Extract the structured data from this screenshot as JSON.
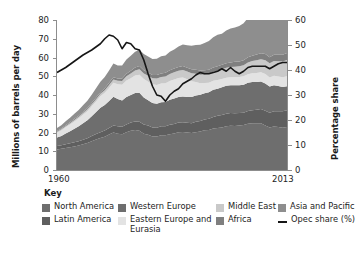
{
  "axes": {
    "y_left_title": "Millions of barrels per day",
    "y_right_title": "Percentage share",
    "y_left_ticks": [
      "0",
      "10",
      "20",
      "30",
      "40",
      "50",
      "60",
      "70",
      "80"
    ],
    "y_right_ticks": [
      "0",
      "10",
      "20",
      "30",
      "40",
      "50",
      "60"
    ],
    "x_ticks": [
      "1960",
      "2013"
    ]
  },
  "legend": {
    "title": "Key",
    "items": [
      {
        "label": "North America",
        "color": "#6e6e6e",
        "type": "area",
        "name": "legend-north-america"
      },
      {
        "label": "Western Europe",
        "color": "#6e6e6e",
        "type": "area",
        "name": "legend-western-europe"
      },
      {
        "label": "Middle East",
        "color": "#c9c9c9",
        "type": "area",
        "name": "legend-middle-east"
      },
      {
        "label": "Asia and Pacific",
        "color": "#8e8e8e",
        "type": "area",
        "name": "legend-asia-pacific"
      },
      {
        "label": "Latin America",
        "color": "#5f5f5f",
        "type": "area",
        "name": "legend-latin-america"
      },
      {
        "label": "Eastern Europe and Eurasia",
        "color": "#e3e3e3",
        "type": "area",
        "name": "legend-eastern-europe-eurasia"
      },
      {
        "label": "Africa",
        "color": "#7f7f7f",
        "type": "area",
        "name": "legend-africa"
      },
      {
        "label": "Opec share (%)",
        "color": "#161616",
        "type": "line",
        "name": "legend-opec-share"
      }
    ]
  },
  "chart_data": {
    "type": "area",
    "title": "",
    "xlabel": "",
    "ylabel": "Millions of barrels per day",
    "ylabel_secondary": "Percentage share",
    "xlim": [
      1960,
      2013
    ],
    "ylim": [
      0,
      80
    ],
    "ylim_secondary": [
      0,
      60
    ],
    "grid": false,
    "legend_position": "bottom",
    "stacked": true,
    "x": [
      1960,
      1961,
      1962,
      1963,
      1964,
      1965,
      1966,
      1967,
      1968,
      1969,
      1970,
      1971,
      1972,
      1973,
      1974,
      1975,
      1976,
      1977,
      1978,
      1979,
      1980,
      1981,
      1982,
      1983,
      1984,
      1985,
      1986,
      1987,
      1988,
      1989,
      1990,
      1991,
      1992,
      1993,
      1994,
      1995,
      1996,
      1997,
      1998,
      1999,
      2000,
      2001,
      2002,
      2003,
      2004,
      2005,
      2006,
      2007,
      2008,
      2009,
      2010,
      2011,
      2012,
      2013
    ],
    "series": [
      {
        "name": "North America",
        "color": "#6e6e6e",
        "values": [
          11.0,
          11.3,
          11.8,
          12.2,
          12.6,
          13.1,
          13.8,
          14.4,
          15.4,
          16.3,
          17.1,
          17.8,
          18.9,
          20.0,
          19.4,
          19.1,
          20.1,
          20.9,
          21.3,
          20.9,
          19.4,
          18.8,
          17.9,
          17.9,
          18.5,
          18.6,
          19.1,
          19.5,
          20.1,
          20.3,
          20.0,
          19.7,
          20.2,
          20.6,
          21.2,
          21.4,
          22.1,
          22.4,
          22.7,
          23.3,
          23.6,
          23.5,
          23.7,
          24.0,
          24.7,
          24.9,
          24.9,
          25.0,
          23.8,
          22.7,
          23.2,
          22.9,
          22.6,
          23.0
        ]
      },
      {
        "name": "Latin America",
        "color": "#5f5f5f",
        "values": [
          1.8,
          1.9,
          2.0,
          2.1,
          2.2,
          2.3,
          2.4,
          2.5,
          2.7,
          2.9,
          3.1,
          3.3,
          3.5,
          3.8,
          3.9,
          4.0,
          4.2,
          4.4,
          4.6,
          4.8,
          4.9,
          4.9,
          4.8,
          4.7,
          4.8,
          4.8,
          5.0,
          5.1,
          5.2,
          5.2,
          5.2,
          5.3,
          5.5,
          5.6,
          5.8,
          5.9,
          6.2,
          6.5,
          6.7,
          6.7,
          6.8,
          6.8,
          6.7,
          6.6,
          6.8,
          7.0,
          7.2,
          7.5,
          7.8,
          7.8,
          8.2,
          8.5,
          8.7,
          8.9
        ]
      },
      {
        "name": "Western Europe",
        "color": "#6e6e6e",
        "values": [
          4.5,
          5.0,
          5.7,
          6.4,
          7.2,
          8.0,
          8.8,
          9.6,
          10.6,
          11.7,
          13.0,
          13.6,
          14.4,
          15.3,
          14.6,
          14.0,
          14.7,
          14.7,
          15.2,
          15.5,
          14.4,
          13.5,
          13.0,
          12.8,
          12.8,
          12.9,
          13.3,
          13.5,
          13.6,
          13.7,
          13.7,
          13.9,
          14.0,
          13.9,
          14.0,
          14.2,
          14.5,
          14.5,
          14.7,
          14.9,
          14.8,
          14.9,
          14.8,
          14.9,
          15.0,
          15.0,
          14.9,
          14.7,
          14.6,
          14.0,
          13.8,
          13.4,
          13.0,
          12.8
        ]
      },
      {
        "name": "Eastern Europe and Eurasia",
        "color": "#e3e3e3",
        "values": [
          2.6,
          2.9,
          3.3,
          3.6,
          3.9,
          4.2,
          4.5,
          4.9,
          5.3,
          5.7,
          6.1,
          6.5,
          7.0,
          7.4,
          7.8,
          8.3,
          8.7,
          9.0,
          9.3,
          9.6,
          9.8,
          9.9,
          10.0,
          10.0,
          10.0,
          10.0,
          10.1,
          10.2,
          10.2,
          10.1,
          9.5,
          8.5,
          7.2,
          6.2,
          5.4,
          5.0,
          4.8,
          4.6,
          4.4,
          4.3,
          4.3,
          4.3,
          4.4,
          4.5,
          4.6,
          4.7,
          4.8,
          4.9,
          5.0,
          4.8,
          5.0,
          5.1,
          5.2,
          5.3
        ]
      },
      {
        "name": "Middle East",
        "color": "#c9c9c9",
        "values": [
          0.5,
          0.6,
          0.6,
          0.7,
          0.8,
          0.8,
          0.9,
          1.0,
          1.1,
          1.2,
          1.3,
          1.4,
          1.6,
          1.8,
          1.9,
          2.1,
          2.3,
          2.5,
          2.7,
          2.9,
          3.0,
          3.1,
          3.2,
          3.4,
          3.5,
          3.6,
          3.7,
          3.8,
          3.9,
          4.0,
          4.1,
          4.2,
          4.4,
          4.5,
          4.6,
          4.7,
          4.8,
          5.0,
          5.2,
          5.3,
          5.4,
          5.6,
          5.7,
          5.9,
          6.2,
          6.5,
          6.8,
          7.0,
          7.4,
          7.6,
          7.9,
          8.1,
          8.4,
          8.7
        ]
      },
      {
        "name": "Africa",
        "color": "#7f7f7f",
        "values": [
          0.4,
          0.4,
          0.5,
          0.5,
          0.6,
          0.6,
          0.7,
          0.7,
          0.8,
          0.9,
          0.9,
          1.0,
          1.1,
          1.2,
          1.2,
          1.3,
          1.4,
          1.5,
          1.6,
          1.7,
          1.7,
          1.8,
          1.8,
          1.9,
          1.9,
          1.9,
          2.0,
          2.0,
          2.0,
          2.1,
          2.1,
          2.1,
          2.2,
          2.2,
          2.2,
          2.3,
          2.3,
          2.4,
          2.4,
          2.5,
          2.5,
          2.6,
          2.6,
          2.7,
          2.8,
          2.9,
          3.0,
          3.1,
          3.2,
          3.3,
          3.4,
          3.5,
          3.6,
          3.7
        ]
      },
      {
        "name": "Asia and Pacific",
        "color": "#8e8e8e",
        "values": [
          1.6,
          1.8,
          2.1,
          2.4,
          2.7,
          3.0,
          3.4,
          3.8,
          4.3,
          4.9,
          5.6,
          6.0,
          6.6,
          7.3,
          7.0,
          7.0,
          7.6,
          8.0,
          8.4,
          8.7,
          8.6,
          8.5,
          8.5,
          8.7,
          9.1,
          9.3,
          9.8,
          10.2,
          10.9,
          11.5,
          12.0,
          12.6,
          13.2,
          13.8,
          14.5,
          15.3,
          16.1,
          16.8,
          16.6,
          17.4,
          18.0,
          18.3,
          18.9,
          19.7,
          21.0,
          21.6,
          22.3,
          23.0,
          23.4,
          24.0,
          25.4,
          26.1,
          27.0,
          27.9
        ]
      }
    ],
    "secondary_series": {
      "name": "Opec share (%)",
      "color": "#161616",
      "unit": "%",
      "x": [
        1960,
        1962,
        1964,
        1966,
        1968,
        1970,
        1971,
        1972,
        1973,
        1974,
        1975,
        1976,
        1977,
        1978,
        1979,
        1980,
        1981,
        1982,
        1983,
        1984,
        1985,
        1986,
        1987,
        1988,
        1989,
        1990,
        1991,
        1992,
        1993,
        1994,
        1995,
        1996,
        1997,
        1998,
        1999,
        2000,
        2001,
        2002,
        2003,
        2004,
        2005,
        2006,
        2007,
        2008,
        2009,
        2010,
        2011,
        2012,
        2013
      ],
      "values": [
        39.0,
        41.0,
        43.5,
        46.0,
        48.0,
        50.5,
        52.5,
        54.0,
        53.5,
        52.0,
        48.5,
        51.0,
        50.5,
        48.5,
        48.0,
        44.0,
        38.5,
        33.5,
        30.0,
        29.5,
        27.5,
        30.0,
        31.5,
        32.5,
        34.5,
        35.5,
        36.5,
        38.0,
        39.0,
        38.5,
        38.5,
        39.0,
        39.5,
        40.5,
        39.5,
        41.0,
        39.5,
        38.5,
        39.5,
        41.0,
        41.5,
        41.5,
        41.5,
        41.5,
        40.5,
        41.5,
        42.5,
        43.0,
        43.0
      ]
    }
  }
}
